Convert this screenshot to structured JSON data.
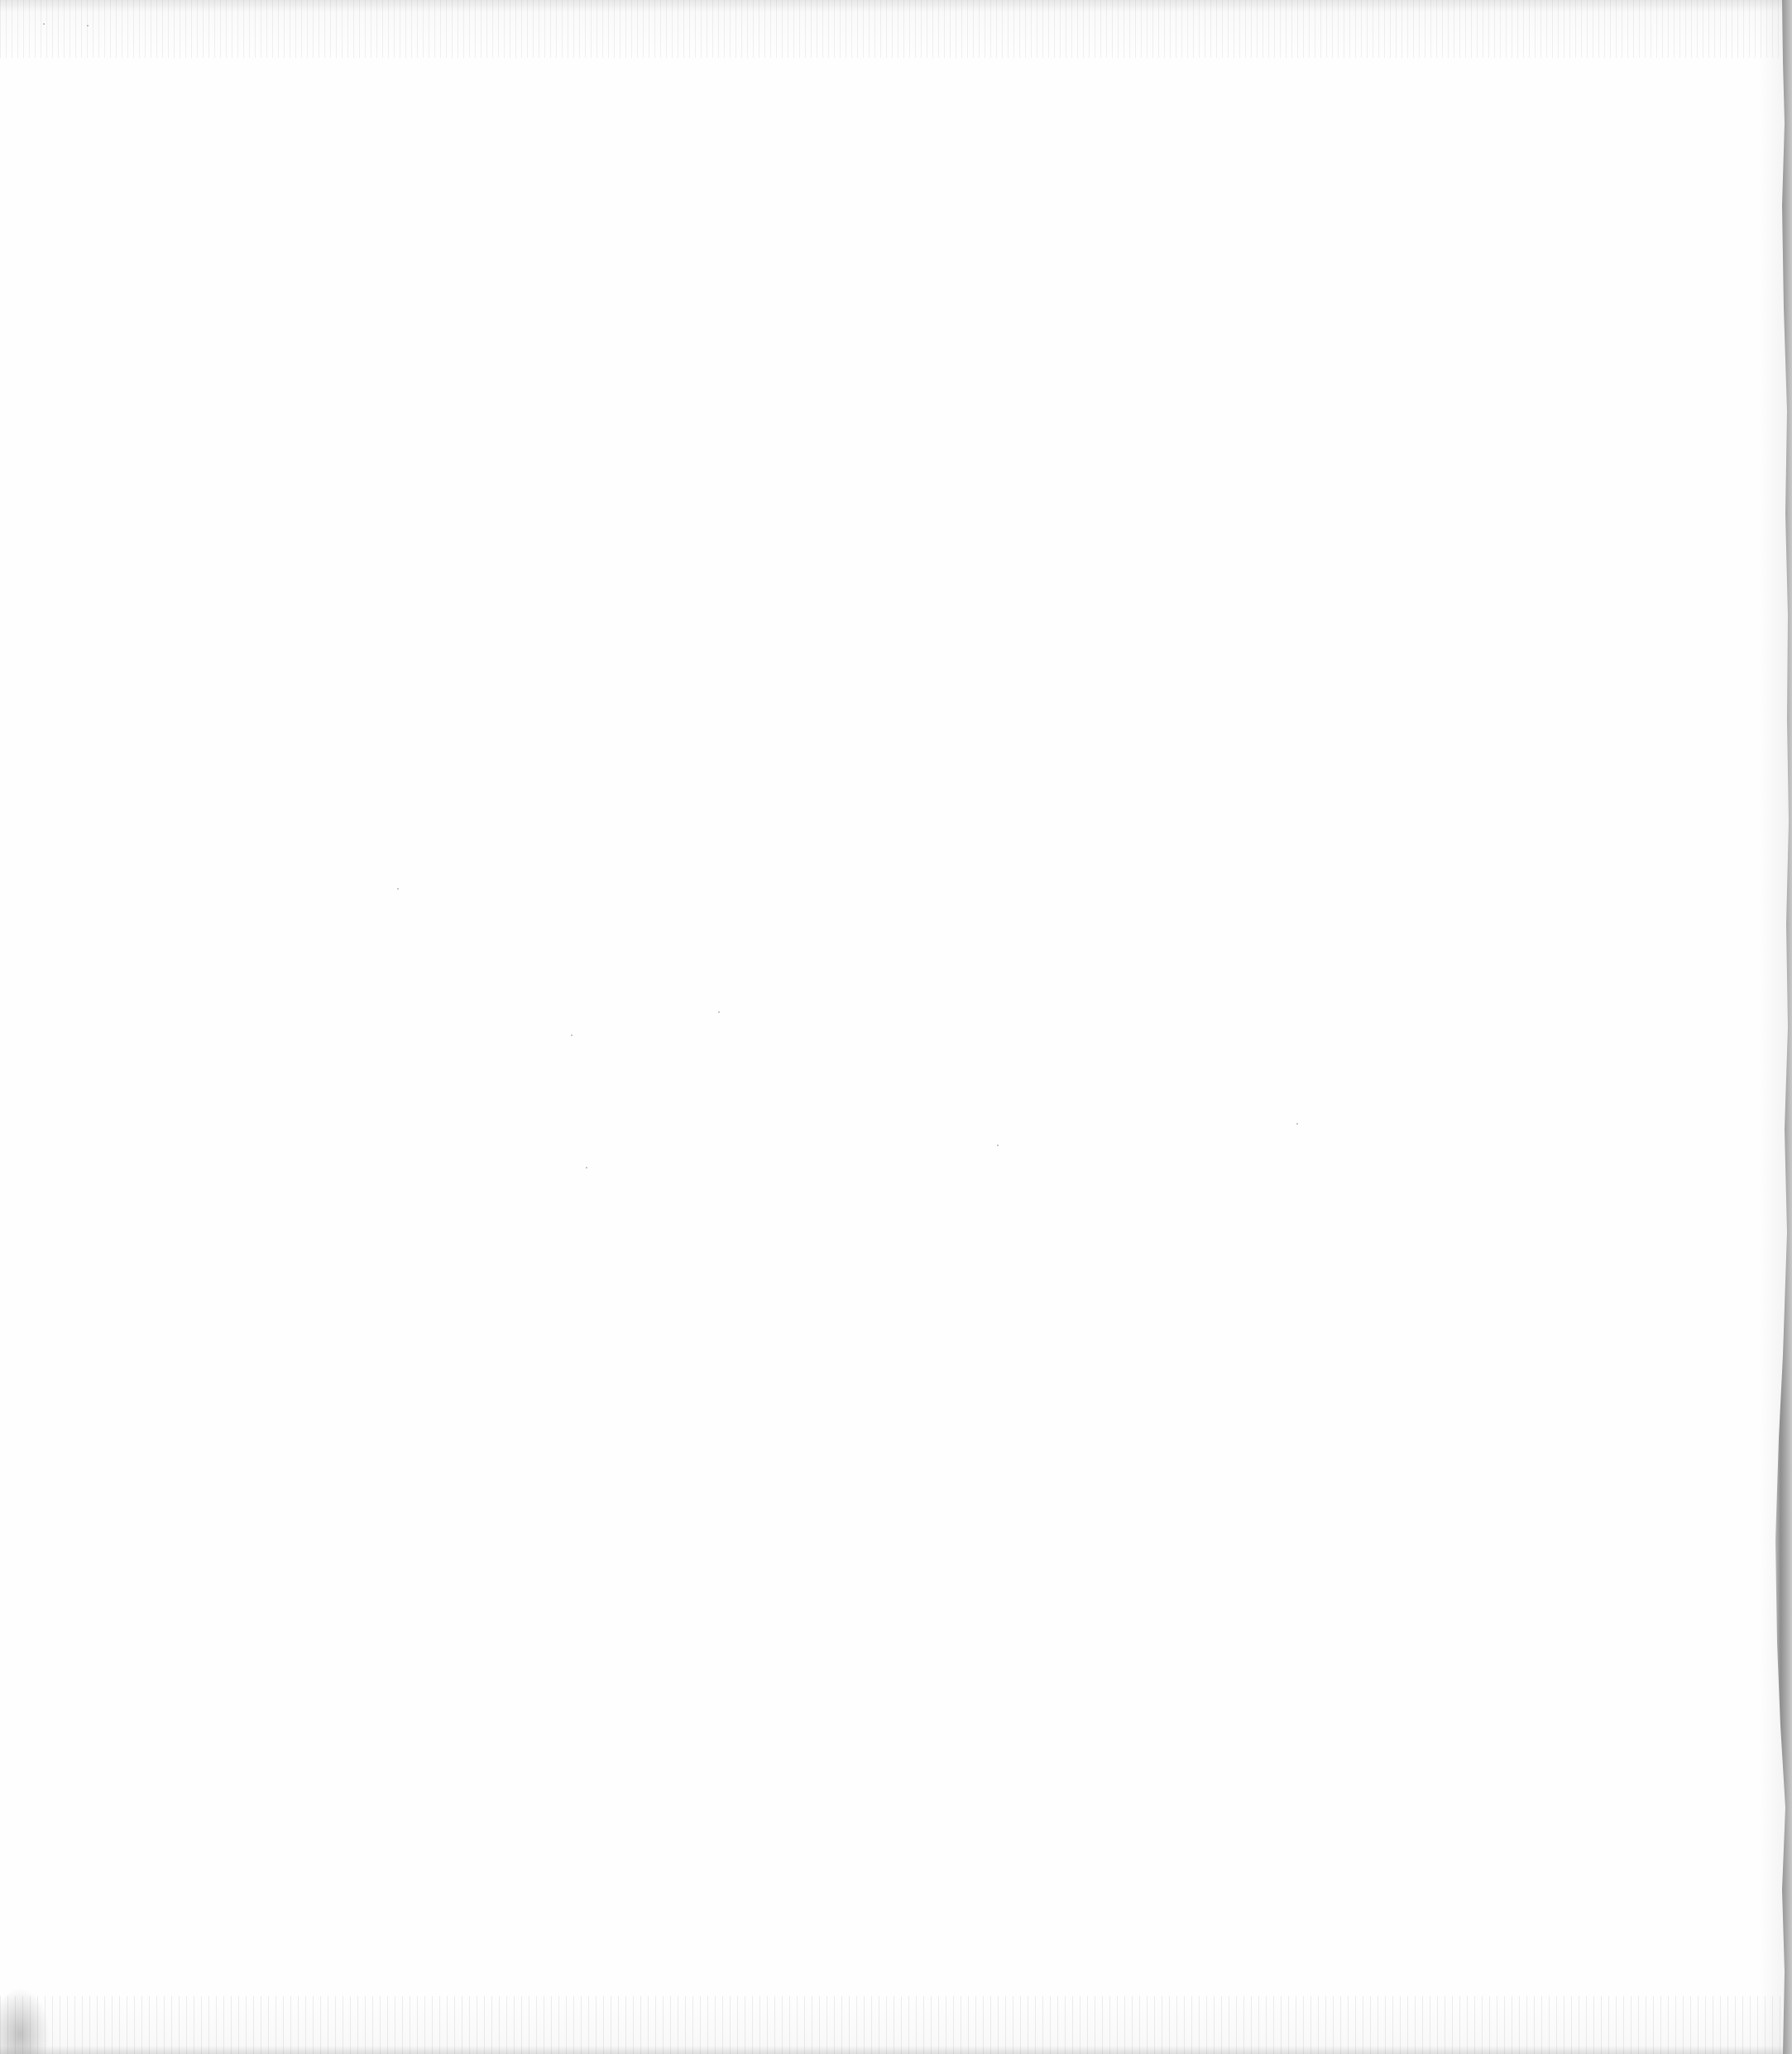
{
  "document": {
    "type": "blank-scanned-page",
    "content": [],
    "colors": {
      "paper": "#fefefe",
      "edge_shadow": "#8e8e8e",
      "noise": "#787878"
    }
  }
}
